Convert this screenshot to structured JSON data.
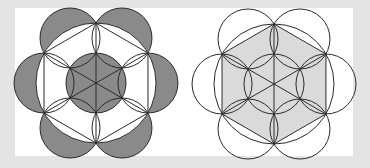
{
  "colors": {
    "background": "#e4e4e4",
    "panel": "#ffffff",
    "stroke": "#2a2a2a",
    "dark_fill": "#8a8a8a",
    "light_fill": "#dadada"
  },
  "figures": [
    {
      "name": "left-figure",
      "description": "Regular hexagon inscribed in circle with six semicircular petals on its edges; shaded petal crescents and shaded inner circle",
      "center": [
        96,
        83
      ],
      "circumradius": 60,
      "inner_circle_radius": 30,
      "petal_radius": 30,
      "shaded": [
        "petal-crescents",
        "inner-circle"
      ]
    },
    {
      "name": "right-figure",
      "description": "Same construction with hexagon shaded light gray; petals and circles unshaded",
      "center": [
        274,
        84
      ],
      "circumradius": 60,
      "inner_circle_radius": 30,
      "petal_radius": 30,
      "shaded": [
        "hexagon"
      ]
    }
  ]
}
